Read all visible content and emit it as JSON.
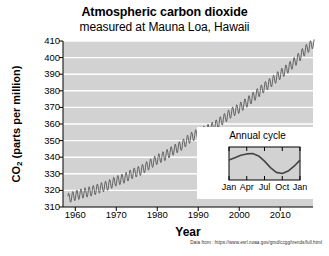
{
  "chart_data": {
    "type": "line",
    "title": "Atmospheric carbon dioxide",
    "subtitle": "measured at Mauna Loa, Hawaii",
    "xlabel": "Year",
    "ylabel_html": "CO2 (parts per million)",
    "ylabel_prefix": "CO",
    "ylabel_sub": "2",
    "ylabel_suffix": " (parts per million)",
    "xlim": [
      1957,
      2018
    ],
    "ylim": [
      310,
      410
    ],
    "xticks": [
      1960,
      1970,
      1980,
      1990,
      2000,
      2010
    ],
    "yticks": [
      310,
      320,
      330,
      340,
      350,
      360,
      370,
      380,
      390,
      400,
      410
    ],
    "grid": "horizontal-white",
    "plot_bg": "#d2d2d2",
    "line_color": "#555555",
    "legend": "none",
    "series": [
      {
        "name": "Monthly mean CO2 (Mauna Loa)",
        "description": "Rising trend with ~6 ppm peak-to-peak annual sawtooth oscillation",
        "seasonal_amplitude_ppm": 6,
        "x": [
          1958,
          1960,
          1962,
          1964,
          1966,
          1968,
          1970,
          1972,
          1974,
          1976,
          1978,
          1980,
          1982,
          1984,
          1986,
          1988,
          1990,
          1992,
          1994,
          1996,
          1998,
          2000,
          2002,
          2004,
          2006,
          2008,
          2010,
          2012,
          2014,
          2016,
          2018
        ],
        "values": [
          315.0,
          316.9,
          318.4,
          319.6,
          321.4,
          323.1,
          325.7,
          327.4,
          330.2,
          332.1,
          335.4,
          338.7,
          341.1,
          344.4,
          347.2,
          351.6,
          354.4,
          356.4,
          358.8,
          362.6,
          366.7,
          369.5,
          373.3,
          377.5,
          381.9,
          385.6,
          389.9,
          393.8,
          398.6,
          404.2,
          408.5
        ]
      }
    ],
    "inset": {
      "title": "Annual cycle",
      "type": "line",
      "xticks": [
        "Jan",
        "Apr",
        "Jul",
        "Oct",
        "Jan"
      ],
      "description": "Seasonal CO2 cycle: rises to May peak, falls to September-October minimum",
      "x": [
        "Jan",
        "Feb",
        "Mar",
        "Apr",
        "May",
        "Jun",
        "Jul",
        "Aug",
        "Sep",
        "Oct",
        "Nov",
        "Dec",
        "Jan"
      ],
      "values": [
        1.2,
        1.9,
        2.6,
        3.0,
        3.1,
        2.4,
        0.9,
        -1.0,
        -2.4,
        -2.7,
        -2.0,
        -0.6,
        1.2
      ]
    },
    "citation": "Data from : https://www.esrl.noaa.gov/gmd/ccgg/trends/full.html"
  }
}
